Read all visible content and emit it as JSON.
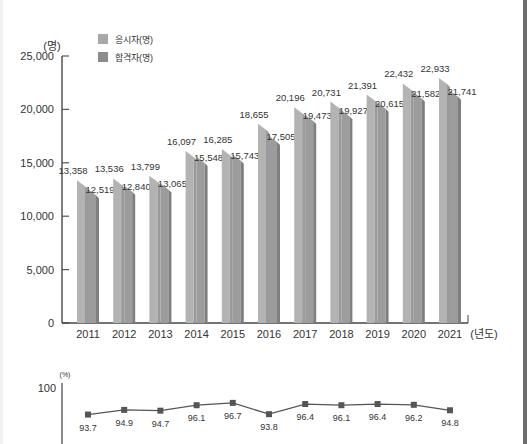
{
  "chart_data": [
    {
      "type": "bar",
      "title": "",
      "ylabel": "(명)",
      "xlabel": "(년도)",
      "ylim": [
        0,
        25000
      ],
      "yticks": [
        0,
        5000,
        10000,
        15000,
        20000,
        25000
      ],
      "ytick_labels": [
        "0",
        "5,000",
        "10,000",
        "15,000",
        "20,000",
        "25,000"
      ],
      "grid": false,
      "legend_position": "top-left",
      "categories": [
        "2011",
        "2012",
        "2013",
        "2014",
        "2015",
        "2016",
        "2017",
        "2018",
        "2019",
        "2020",
        "2021"
      ],
      "series": [
        {
          "name": "응시자(명)",
          "color": "#a8a8a8",
          "values": [
            13358,
            13536,
            13799,
            16097,
            16285,
            18655,
            20196,
            20731,
            21391,
            22432,
            22933
          ],
          "labels": [
            "13,358",
            "13,536",
            "13,799",
            "16,097",
            "16,285",
            "18,655",
            "20,196",
            "20,731",
            "21,391",
            "22,432",
            "22,933"
          ]
        },
        {
          "name": "합격자(명)",
          "color": "#8c8c8c",
          "values": [
            12519,
            12840,
            13065,
            15548,
            15743,
            17505,
            19473,
            19927,
            20615,
            21582,
            21741
          ],
          "labels": [
            "12,519",
            "12,840",
            "13,065",
            "15,548",
            "15,743",
            "17,505",
            "19,473",
            "19,927",
            "20,615",
            "21,582",
            "21,741"
          ]
        }
      ]
    },
    {
      "type": "line",
      "title": "",
      "ylabel": "(%)",
      "ytick_labels": [
        "100"
      ],
      "categories": [
        "2011",
        "2012",
        "2013",
        "2014",
        "2015",
        "2016",
        "2017",
        "2018",
        "2019",
        "2020",
        "2021"
      ],
      "series": [
        {
          "name": "합격률(%)",
          "color": "#555555",
          "values": [
            93.7,
            94.9,
            94.7,
            96.1,
            96.7,
            93.8,
            96.4,
            96.1,
            96.4,
            96.2,
            94.8
          ],
          "labels": [
            "93.7",
            "94.9",
            "94.7",
            "96.1",
            "96.7",
            "93.8",
            "96.4",
            "96.1",
            "96.4",
            "96.2",
            "94.8"
          ]
        }
      ]
    }
  ]
}
